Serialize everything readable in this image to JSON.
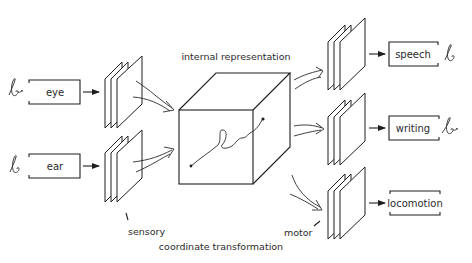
{
  "diagram": {
    "title": "internal representation",
    "center": {
      "label": "internal representation",
      "shape": "cube-with-trajectory"
    },
    "inputs": [
      {
        "id": "eye",
        "label": "eye",
        "icon": "cursive-b-glyph"
      },
      {
        "id": "ear",
        "label": "ear",
        "icon": "cursive-b-glyph"
      }
    ],
    "outputs": [
      {
        "id": "speech",
        "label": "speech",
        "icon": "cursive-b-glyph"
      },
      {
        "id": "writing",
        "label": "writing",
        "icon": "cursive-b-glyph"
      },
      {
        "id": "locomotion",
        "label": "locomotion",
        "icon": ""
      }
    ],
    "annotations": {
      "sensory": "sensory",
      "motor": "motor",
      "coordinate_transformation": "coordinate transformation"
    },
    "colors": {
      "stroke": "#1e1e1e",
      "text": "#2a2a2a",
      "background": "#ffffff"
    }
  }
}
